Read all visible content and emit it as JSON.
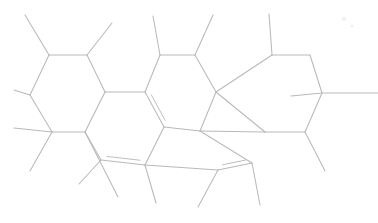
{
  "document": {
    "title": "Skeletal Structure Diagram",
    "kind": "chemical-structure",
    "width": 378,
    "height": 223,
    "background_color": "#ffffff"
  },
  "style": {
    "bond_color": "#b9b9b9",
    "bond_inner_color": "#bfbfbf",
    "bond_width": 1.05,
    "speck_color": "#f2f2f2"
  },
  "structure": {
    "description": "Fused polycyclic hydrocarbon skeleton with methyl and isopropyl substituents and three double bonds",
    "vertices": [
      {
        "id": "v1",
        "name": "ring-a-c1",
        "x": 49,
        "y": 55
      },
      {
        "id": "v2",
        "name": "ring-a-c2",
        "x": 87,
        "y": 55
      },
      {
        "id": "v3",
        "name": "ring-a-c3",
        "x": 105,
        "y": 92
      },
      {
        "id": "v4",
        "name": "ring-a-c4",
        "x": 85,
        "y": 132
      },
      {
        "id": "v5",
        "name": "ring-a-c5",
        "x": 52,
        "y": 132
      },
      {
        "id": "v6",
        "name": "ring-a-c6",
        "x": 30,
        "y": 95
      },
      {
        "id": "v7",
        "name": "ring-b-c1",
        "x": 145,
        "y": 92
      },
      {
        "id": "v8",
        "name": "ring-b-c2",
        "x": 160,
        "y": 55
      },
      {
        "id": "v9",
        "name": "ring-b-c3",
        "x": 195,
        "y": 55
      },
      {
        "id": "v10",
        "name": "ring-b-c4",
        "x": 216,
        "y": 92
      },
      {
        "id": "v11",
        "name": "ring-c-c1",
        "x": 200,
        "y": 131
      },
      {
        "id": "v12",
        "name": "ring-c-c2",
        "x": 164,
        "y": 127
      },
      {
        "id": "v13",
        "name": "ring-c-c3",
        "x": 145,
        "y": 165
      },
      {
        "id": "v14",
        "name": "ring-c-c4",
        "x": 101,
        "y": 160
      },
      {
        "id": "v15",
        "name": "ring-d-c1",
        "x": 252,
        "y": 163
      },
      {
        "id": "v16",
        "name": "ring-d-c2",
        "x": 218,
        "y": 170
      },
      {
        "id": "v17",
        "name": "ring-d-c3",
        "x": 265,
        "y": 132
      },
      {
        "id": "v18",
        "name": "ring-d-c4",
        "x": 305,
        "y": 132
      },
      {
        "id": "v19",
        "name": "ring-e-c1",
        "x": 272,
        "y": 55
      },
      {
        "id": "v20",
        "name": "ring-e-c2",
        "x": 310,
        "y": 55
      },
      {
        "id": "v21",
        "name": "ring-e-c3",
        "x": 322,
        "y": 93
      },
      {
        "id": "v22",
        "name": "branch-methyl-1",
        "x": 25,
        "y": 15
      },
      {
        "id": "v23",
        "name": "branch-methyl-2",
        "x": 14,
        "y": 90
      },
      {
        "id": "v24",
        "name": "branch-methyl-3",
        "x": 112,
        "y": 23
      },
      {
        "id": "v25",
        "name": "branch-methyl-4",
        "x": 30,
        "y": 171
      },
      {
        "id": "v26",
        "name": "branch-methyl-5",
        "x": 14,
        "y": 128
      },
      {
        "id": "v27",
        "name": "branch-methyl-6",
        "x": 153,
        "y": 16
      },
      {
        "id": "v28",
        "name": "branch-methyl-7",
        "x": 213,
        "y": 15
      },
      {
        "id": "v29",
        "name": "branch-methyl-8",
        "x": 269,
        "y": 14
      },
      {
        "id": "v30",
        "name": "branch-methyl-9",
        "x": 378,
        "y": 93
      },
      {
        "id": "v31",
        "name": "branch-methyl-10",
        "x": 291,
        "y": 96
      },
      {
        "id": "v32",
        "name": "branch-methyl-11",
        "x": 325,
        "y": 171
      },
      {
        "id": "v33",
        "name": "branch-methyl-12",
        "x": 260,
        "y": 205
      },
      {
        "id": "v34",
        "name": "branch-methyl-13",
        "x": 198,
        "y": 207
      },
      {
        "id": "v35",
        "name": "branch-methyl-14",
        "x": 156,
        "y": 203
      },
      {
        "id": "v36",
        "name": "branch-methyl-15",
        "x": 79,
        "y": 184
      },
      {
        "id": "v37",
        "name": "branch-methyl-16",
        "x": 118,
        "y": 197
      }
    ],
    "bonds": [
      {
        "name": "bond-a1-a2",
        "from": "v1",
        "to": "v2",
        "order": 1
      },
      {
        "name": "bond-a2-a3",
        "from": "v2",
        "to": "v3",
        "order": 1
      },
      {
        "name": "bond-a3-a4",
        "from": "v3",
        "to": "v4",
        "order": 1
      },
      {
        "name": "bond-a4-a5",
        "from": "v4",
        "to": "v5",
        "order": 1
      },
      {
        "name": "bond-a5-a6",
        "from": "v5",
        "to": "v6",
        "order": 1
      },
      {
        "name": "bond-a6-a1",
        "from": "v6",
        "to": "v1",
        "order": 1
      },
      {
        "name": "bond-a3-b1",
        "from": "v3",
        "to": "v7",
        "order": 1
      },
      {
        "name": "bond-b1-b2",
        "from": "v7",
        "to": "v8",
        "order": 1
      },
      {
        "name": "bond-b2-b3",
        "from": "v8",
        "to": "v9",
        "order": 1
      },
      {
        "name": "bond-b3-b4",
        "from": "v9",
        "to": "v10",
        "order": 1
      },
      {
        "name": "bond-b4-c1",
        "from": "v10",
        "to": "v11",
        "order": 1
      },
      {
        "name": "bond-c1-c2",
        "from": "v11",
        "to": "v12",
        "order": 1
      },
      {
        "name": "bond-c2-b1",
        "from": "v12",
        "to": "v7",
        "order": 2
      },
      {
        "name": "bond-c2-c3",
        "from": "v12",
        "to": "v13",
        "order": 1
      },
      {
        "name": "bond-c3-c4",
        "from": "v13",
        "to": "v14",
        "order": 2
      },
      {
        "name": "bond-c4-a4",
        "from": "v14",
        "to": "v4",
        "order": 1
      },
      {
        "name": "bond-c1-d1",
        "from": "v11",
        "to": "v15",
        "order": 1
      },
      {
        "name": "bond-d1-d2",
        "from": "v15",
        "to": "v16",
        "order": 2
      },
      {
        "name": "bond-d2-c3",
        "from": "v16",
        "to": "v13",
        "order": 1
      },
      {
        "name": "bond-c1-d3",
        "from": "v11",
        "to": "v17",
        "order": 1
      },
      {
        "name": "bond-d3-d4",
        "from": "v17",
        "to": "v18",
        "order": 1
      },
      {
        "name": "bond-d4-e3",
        "from": "v18",
        "to": "v21",
        "order": 1
      },
      {
        "name": "bond-e3-e2",
        "from": "v21",
        "to": "v20",
        "order": 1
      },
      {
        "name": "bond-e2-e1",
        "from": "v20",
        "to": "v19",
        "order": 1
      },
      {
        "name": "bond-e1-b4",
        "from": "v19",
        "to": "v10",
        "order": 1
      },
      {
        "name": "bond-b4-d3",
        "from": "v10",
        "to": "v17",
        "order": 1
      },
      {
        "name": "sub-a1-m1",
        "from": "v1",
        "to": "v22",
        "order": 1
      },
      {
        "name": "sub-a6-m2",
        "from": "v6",
        "to": "v23",
        "order": 1
      },
      {
        "name": "sub-a2-m3",
        "from": "v2",
        "to": "v24",
        "order": 1
      },
      {
        "name": "sub-a5-m4",
        "from": "v5",
        "to": "v25",
        "order": 1
      },
      {
        "name": "sub-a5-m5",
        "from": "v5",
        "to": "v26",
        "order": 1
      },
      {
        "name": "sub-b2-m6",
        "from": "v8",
        "to": "v27",
        "order": 1
      },
      {
        "name": "sub-b3-m7",
        "from": "v9",
        "to": "v28",
        "order": 1
      },
      {
        "name": "sub-e1-m8",
        "from": "v19",
        "to": "v29",
        "order": 1
      },
      {
        "name": "sub-e3-m9",
        "from": "v21",
        "to": "v30",
        "order": 1
      },
      {
        "name": "sub-e3-m10",
        "from": "v21",
        "to": "v31",
        "order": 1
      },
      {
        "name": "sub-d4-m11",
        "from": "v18",
        "to": "v32",
        "order": 1
      },
      {
        "name": "sub-d1-m12",
        "from": "v15",
        "to": "v33",
        "order": 1
      },
      {
        "name": "sub-d2-m13",
        "from": "v16",
        "to": "v34",
        "order": 1
      },
      {
        "name": "sub-c3-m14",
        "from": "v13",
        "to": "v35",
        "order": 1
      },
      {
        "name": "sub-c4-m15",
        "from": "v14",
        "to": "v36",
        "order": 1
      },
      {
        "name": "sub-a4-m16",
        "from": "v4",
        "to": "v37",
        "order": 1
      }
    ],
    "specks": [
      {
        "name": "artifact-speck-1",
        "x": 344,
        "y": 19,
        "r": 2.2
      },
      {
        "name": "artifact-speck-2",
        "x": 352,
        "y": 26,
        "r": 1.6
      }
    ]
  }
}
